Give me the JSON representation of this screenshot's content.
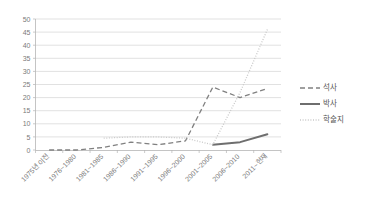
{
  "chart_data": {
    "type": "line",
    "title": "",
    "xlabel": "",
    "ylabel": "",
    "ylim": [
      0,
      50
    ],
    "ytick_step": 5,
    "yticks": [
      "0",
      "5",
      "10",
      "15",
      "20",
      "25",
      "30",
      "35",
      "40",
      "45",
      "50"
    ],
    "grid": true,
    "legend_position": "right",
    "categories": [
      "1975년 이전",
      "1976~1980",
      "1981~1985",
      "1986~1990",
      "1991~1995",
      "1996~2000",
      "2001~2005",
      "2006~2010",
      "2011~현재"
    ],
    "series": [
      {
        "name": "석사",
        "style": "dashed",
        "color": "#808080",
        "values": [
          0,
          0,
          1,
          3,
          2,
          3.5,
          24,
          20,
          23.5
        ]
      },
      {
        "name": "박사",
        "style": "solid",
        "color": "#6e6e6e",
        "values": [
          null,
          null,
          null,
          null,
          null,
          null,
          2,
          3,
          6
        ]
      },
      {
        "name": "학술지",
        "style": "dotted",
        "color": "#c9c9c9",
        "values": [
          null,
          null,
          4.5,
          5,
          5,
          4.5,
          2,
          22,
          46
        ]
      }
    ]
  },
  "legend": {
    "items": [
      {
        "label": "석사"
      },
      {
        "label": "박사"
      },
      {
        "label": "학술지"
      }
    ]
  },
  "colors": {
    "grid": "#d4d4d4",
    "axis": "#b5b5b5",
    "tick_text": "#7a7a7a",
    "legend_text": "#555555",
    "background": "#ffffff"
  }
}
